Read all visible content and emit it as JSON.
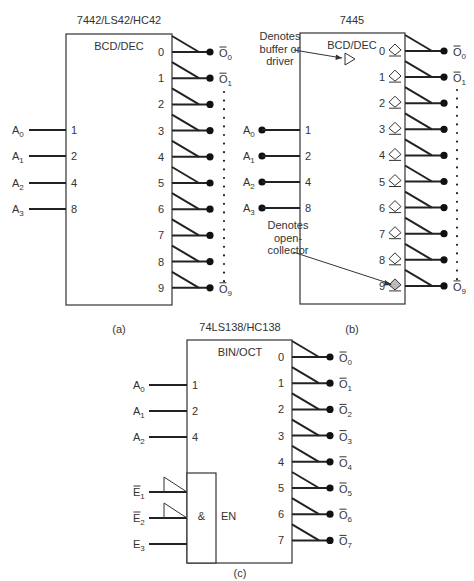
{
  "figure": {
    "parts": [
      {
        "id": "a",
        "chip_label": "7442/LS42/HC42",
        "function_label": "BCD/DEC",
        "caption": "(a)",
        "inputs": [
          {
            "name": "A",
            "sub": "0",
            "weight": "1"
          },
          {
            "name": "A",
            "sub": "1",
            "weight": "2"
          },
          {
            "name": "A",
            "sub": "2",
            "weight": "4"
          },
          {
            "name": "A",
            "sub": "3",
            "weight": "8"
          }
        ],
        "outputs": [
          "0",
          "1",
          "2",
          "3",
          "4",
          "5",
          "6",
          "7",
          "8",
          "9"
        ],
        "output_labels": [
          {
            "index": 0,
            "name": "O",
            "sub": "0",
            "overbar": true
          },
          {
            "index": 1,
            "name": "O",
            "sub": "1",
            "overbar": true
          },
          {
            "index": 9,
            "name": "O",
            "sub": "9",
            "overbar": true
          }
        ],
        "input_dots": false,
        "open_collector": false
      },
      {
        "id": "b",
        "chip_label": "7445",
        "function_label": "BCD/DEC",
        "caption": "(b)",
        "inputs": [
          {
            "name": "A",
            "sub": "0",
            "weight": "1"
          },
          {
            "name": "A",
            "sub": "1",
            "weight": "2"
          },
          {
            "name": "A",
            "sub": "2",
            "weight": "4"
          },
          {
            "name": "A",
            "sub": "3",
            "weight": "8"
          }
        ],
        "outputs": [
          "0",
          "1",
          "2",
          "3",
          "4",
          "5",
          "6",
          "7",
          "8",
          "9"
        ],
        "output_labels": [
          {
            "index": 0,
            "name": "O",
            "sub": "0",
            "overbar": true
          },
          {
            "index": 1,
            "name": "O",
            "sub": "1",
            "overbar": true
          },
          {
            "index": 9,
            "name": "O",
            "sub": "9",
            "overbar": true
          }
        ],
        "input_dots": true,
        "open_collector": true,
        "annotations": [
          {
            "text_lines": [
              "Denotes",
              "buffer or",
              "driver"
            ],
            "points_to": "buffer-symbol"
          },
          {
            "text_lines": [
              "Denotes",
              "open-",
              "collector"
            ],
            "points_to": "open-collector-symbol-9"
          }
        ]
      },
      {
        "id": "c",
        "chip_label": "74LS138/HC138",
        "function_label": "BIN/OCT",
        "caption": "(c)",
        "inputs": [
          {
            "name": "A",
            "sub": "0",
            "weight": "1"
          },
          {
            "name": "A",
            "sub": "1",
            "weight": "2"
          },
          {
            "name": "A",
            "sub": "2",
            "weight": "4"
          }
        ],
        "enables": [
          {
            "name": "E",
            "sub": "1",
            "overbar": true,
            "active_low": true
          },
          {
            "name": "E",
            "sub": "2",
            "overbar": true,
            "active_low": true
          },
          {
            "name": "E",
            "sub": "3",
            "overbar": false,
            "active_low": false
          }
        ],
        "enable_gate_label": "&",
        "enable_label": "EN",
        "outputs": [
          "0",
          "1",
          "2",
          "3",
          "4",
          "5",
          "6",
          "7"
        ],
        "output_labels": [
          {
            "index": 0,
            "name": "O",
            "sub": "0",
            "overbar": true
          },
          {
            "index": 1,
            "name": "O",
            "sub": "1",
            "overbar": true
          },
          {
            "index": 2,
            "name": "O",
            "sub": "2",
            "overbar": true
          },
          {
            "index": 3,
            "name": "O",
            "sub": "3",
            "overbar": true
          },
          {
            "index": 4,
            "name": "O",
            "sub": "4",
            "overbar": true
          },
          {
            "index": 5,
            "name": "O",
            "sub": "5",
            "overbar": true
          },
          {
            "index": 6,
            "name": "O",
            "sub": "6",
            "overbar": true
          },
          {
            "index": 7,
            "name": "O",
            "sub": "7",
            "overbar": true
          }
        ],
        "input_dots": false,
        "open_collector": false
      }
    ]
  },
  "colors": {
    "line": "#222222",
    "text": "#333333",
    "background": "#ffffff"
  }
}
